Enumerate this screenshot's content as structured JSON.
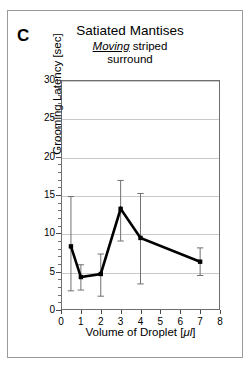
{
  "panel": {
    "label": "C"
  },
  "chart_data": {
    "type": "line",
    "title": "Satiated Mantises",
    "subtitle_emphasis": "Moving",
    "subtitle_rest": " striped",
    "subtitle_line2": "surround",
    "xlabel_prefix": "Volume of Droplet [",
    "xlabel_unit": "μl",
    "xlabel_suffix": "]",
    "ylabel": "Grooming Latency [sec]",
    "xlim": [
      0,
      8
    ],
    "ylim": [
      0,
      30
    ],
    "xticks": [
      0,
      1,
      2,
      3,
      4,
      5,
      6,
      7,
      8
    ],
    "yticks": [
      0,
      5,
      10,
      15,
      20,
      25,
      30
    ],
    "grid": "horizontal",
    "legend": "none",
    "marker": "square",
    "line_color": "#000000",
    "errorbar_color": "#707070",
    "gridline_color": "#c9c9c9",
    "series": [
      {
        "name": "Grooming latency",
        "x": [
          0.5,
          1,
          2,
          3,
          4,
          7
        ],
        "values": [
          8.3,
          4.3,
          4.7,
          13.2,
          9.4,
          6.3
        ],
        "err_low": [
          2.5,
          2.6,
          1.8,
          9.0,
          3.4,
          4.5
        ],
        "err_high": [
          14.8,
          5.9,
          7.3,
          16.9,
          15.2,
          8.1
        ]
      }
    ]
  }
}
